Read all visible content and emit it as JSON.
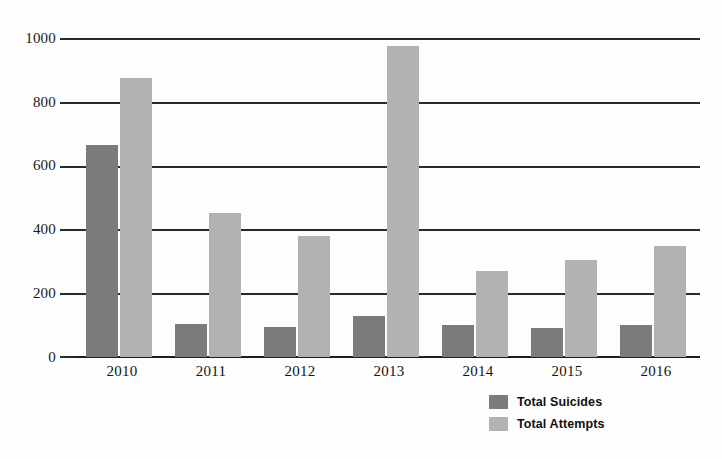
{
  "chart_data": {
    "type": "bar",
    "title": "",
    "subtitle": "",
    "xlabel": "",
    "ylabel": "",
    "categories": [
      "2010",
      "2011",
      "2012",
      "2013",
      "2014",
      "2015",
      "2016"
    ],
    "series": [
      {
        "name": "Total Suicides",
        "color": "#7b7b7b",
        "values": [
          665,
          103,
          95,
          130,
          100,
          92,
          100
        ]
      },
      {
        "name": "Total Attempts",
        "color": "#b2b2b2",
        "values": [
          875,
          450,
          380,
          975,
          270,
          305,
          347
        ]
      }
    ],
    "ylim": [
      0,
      1000
    ],
    "yticks": [
      0,
      200,
      400,
      600,
      800,
      1000
    ],
    "ytick_labels": [
      "0",
      "200",
      "400",
      "600",
      "800",
      "1000"
    ],
    "grid": true,
    "grid_axis": "y",
    "legend_position": "bottom-right",
    "background_color": "#fdfdfd",
    "axis_color": "#2a2a2a"
  },
  "legend": {
    "entries": [
      {
        "label": "Total Suicides",
        "swatch": "dark"
      },
      {
        "label": "Total Attempts",
        "swatch": "light"
      }
    ]
  }
}
